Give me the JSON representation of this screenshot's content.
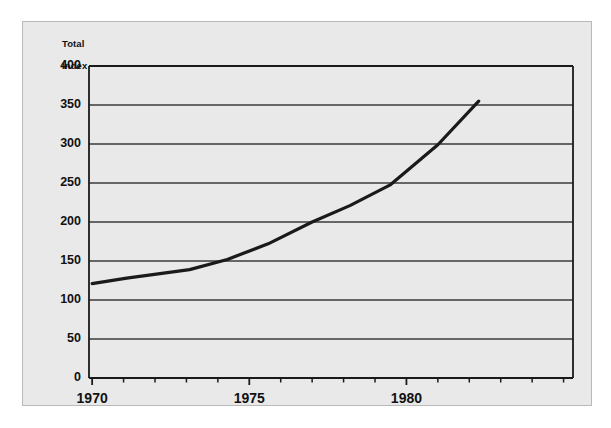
{
  "chart_data": {
    "type": "line",
    "title": "",
    "subtitle": "",
    "ylabel": "Total\nIndex",
    "ylabel_line1": "Total",
    "ylabel_line2": "Index",
    "xlabel": "",
    "xlim": [
      1969.9,
      1985.3
    ],
    "ylim": [
      0,
      400
    ],
    "yticks": [
      0,
      50,
      100,
      150,
      200,
      250,
      300,
      350,
      400
    ],
    "ytick_labels": [
      "0",
      "50",
      "100",
      "150",
      "200",
      "250",
      "300",
      "350",
      "400"
    ],
    "xticks": [
      1970,
      1975,
      1980
    ],
    "xtick_labels": [
      "1970",
      "1975",
      "1980"
    ],
    "x_minor_ticks": [
      1971,
      1972,
      1973,
      1974,
      1976,
      1977,
      1978,
      1979,
      1981,
      1982,
      1983,
      1984,
      1985
    ],
    "grid": "horizontal",
    "legend": "none",
    "series": [
      {
        "name": "Total Index",
        "x": [
          1970.0,
          1971.1,
          1973.1,
          1974.3,
          1975.6,
          1977.0,
          1978.2,
          1979.5,
          1981.0,
          1982.3
        ],
        "values": [
          121,
          128,
          139,
          152,
          172,
          200,
          221,
          248,
          299,
          355
        ]
      }
    ],
    "colors": {
      "line": "#1a1a1a",
      "grid": "#3a3a3a",
      "axis": "#1a1a1a",
      "panel_background": "#e9e9e9",
      "page_background": "#ffffff",
      "panel_border": "#b9b9b9"
    }
  },
  "geometry": {
    "plot_left": 89,
    "plot_right": 573,
    "plot_top": 66,
    "plot_bottom": 378
  }
}
